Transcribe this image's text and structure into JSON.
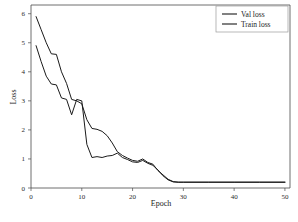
{
  "chart_data": {
    "type": "line",
    "title": "",
    "xlabel": "Epoch",
    "ylabel": "Loss",
    "xlim": [
      0,
      51
    ],
    "ylim": [
      0,
      6.3
    ],
    "xticks": [
      0,
      10,
      20,
      30,
      40,
      50
    ],
    "yticks": [
      0,
      1,
      2,
      3,
      4,
      5,
      6
    ],
    "xticklabels": [
      "0",
      "10",
      "20",
      "30",
      "40",
      "50"
    ],
    "yticklabels": [
      "0",
      "1",
      "2",
      "3",
      "4",
      "5",
      "6"
    ],
    "grid": false,
    "legend_position": "upper right",
    "line_color": "#1a1a1a",
    "series": [
      {
        "name": "Val loss",
        "x": [
          1,
          2,
          3,
          4,
          5,
          6,
          7,
          8,
          9,
          10,
          11,
          12,
          13,
          14,
          15,
          16,
          17,
          18,
          19,
          20,
          21,
          22,
          23,
          24,
          25,
          26,
          27,
          28,
          29,
          30,
          35,
          40,
          45,
          50
        ],
        "values": [
          5.9,
          5.45,
          5.0,
          4.62,
          4.6,
          4.0,
          3.6,
          3.05,
          3.0,
          2.9,
          2.35,
          2.05,
          2.02,
          1.95,
          1.8,
          1.55,
          1.25,
          1.12,
          1.03,
          0.95,
          0.92,
          1.0,
          0.88,
          0.82,
          0.6,
          0.45,
          0.3,
          0.22,
          0.2,
          0.2,
          0.2,
          0.2,
          0.2,
          0.2
        ]
      },
      {
        "name": "Train loss",
        "x": [
          1,
          2,
          3,
          4,
          5,
          6,
          7,
          8,
          9,
          10,
          11,
          12,
          13,
          14,
          15,
          16,
          17,
          18,
          19,
          20,
          21,
          22,
          23,
          24,
          25,
          26,
          27,
          28,
          29,
          30,
          35,
          40,
          45,
          50
        ],
        "values": [
          4.9,
          4.35,
          3.85,
          3.58,
          3.55,
          3.1,
          3.05,
          2.52,
          3.05,
          3.0,
          1.5,
          1.05,
          1.08,
          1.05,
          1.1,
          1.12,
          1.2,
          1.05,
          0.98,
          0.9,
          0.88,
          0.95,
          0.85,
          0.78,
          0.62,
          0.42,
          0.28,
          0.21,
          0.2,
          0.2,
          0.2,
          0.2,
          0.2,
          0.2
        ]
      }
    ]
  },
  "legend": {
    "entries": [
      {
        "label": "Val loss"
      },
      {
        "label": "Train loss"
      }
    ]
  }
}
